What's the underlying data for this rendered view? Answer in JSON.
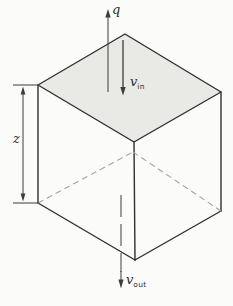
{
  "figure": {
    "type": "control-volume-cube-diagram",
    "labels": {
      "q": "q",
      "z": "z",
      "v_in": {
        "base": "v",
        "sub": "in"
      },
      "v_out": {
        "base": "v",
        "sub": "out"
      }
    },
    "colors": {
      "background": "#fbfbf9",
      "top_face_fill": "#e9e9e5",
      "edge_stroke": "#2f2f2f",
      "hidden_edge_stroke": "#a3a39f",
      "arrow_stroke": "#3c3c3c"
    }
  }
}
